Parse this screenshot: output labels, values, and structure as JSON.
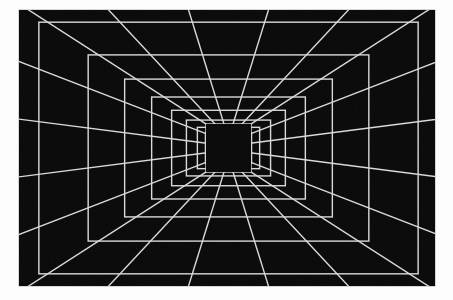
{
  "scene": {
    "title": "One-point perspective grid corridor",
    "type": "perspective-grid-tunnel",
    "canvas": {
      "width": 453,
      "height": 300,
      "background_color": "#fdfdfd"
    },
    "panel": {
      "x": 19,
      "y": 10,
      "width": 416,
      "height": 276,
      "background_color": "#0a0a0a",
      "border_color": "#bfbfbf"
    },
    "line_color": "#d9d9d9",
    "line_width": 1.4,
    "far_wall": {
      "label": "far-wall-dark-square",
      "x": 206,
      "y": 124,
      "width": 45,
      "height": 48,
      "fill": "#0a0a0a"
    },
    "vanishing_point": {
      "x": 228.5,
      "y": 148
    },
    "depth_rings": 12,
    "ring_scale": 0.74,
    "wall_divisions": 5,
    "floor_divisions": 5,
    "radial_lines": 24,
    "notes": "Light gray grid lines on near-black ground converging to a central vanishing point; innermost rectangle is an unlit solid dark square."
  }
}
